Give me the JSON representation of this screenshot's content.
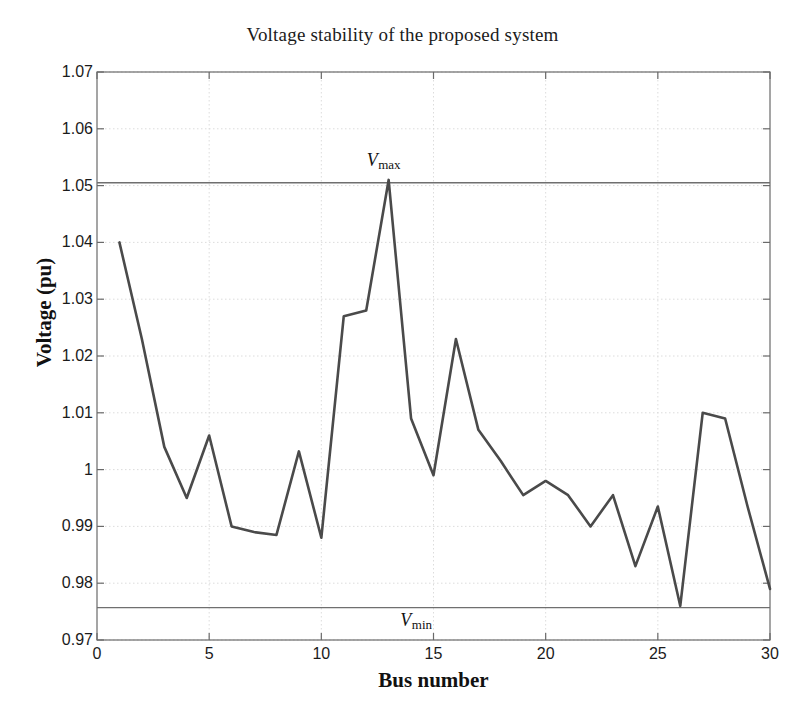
{
  "chart_data": {
    "type": "line",
    "title": "Voltage stability of the proposed system",
    "xlabel": "Bus number",
    "ylabel": "Voltage (pu)",
    "xlim": [
      0,
      30
    ],
    "ylim": [
      0.97,
      1.07
    ],
    "grid": true,
    "legend": "none",
    "xticks": [
      0,
      5,
      10,
      15,
      20,
      25,
      30
    ],
    "xtick_labels": [
      "0",
      "5",
      "10",
      "15",
      "20",
      "25",
      "30"
    ],
    "yticks": [
      0.97,
      0.98,
      0.99,
      1.0,
      1.01,
      1.02,
      1.03,
      1.04,
      1.05,
      1.06,
      1.07
    ],
    "ytick_labels": [
      "0.97",
      "0.98",
      "0.99",
      "1",
      "1.01",
      "1.02",
      "1.03",
      "1.04",
      "1.05",
      "1.06",
      "1.07"
    ],
    "x": [
      1,
      2,
      3,
      4,
      5,
      6,
      7,
      8,
      9,
      10,
      11,
      12,
      13,
      14,
      15,
      16,
      17,
      18,
      19,
      20,
      21,
      22,
      23,
      24,
      25,
      26,
      27,
      28,
      29,
      30
    ],
    "series": [
      {
        "name": "Voltage (pu)",
        "color": "#4a4a4a",
        "values": [
          1.04,
          1.023,
          1.004,
          0.995,
          1.006,
          0.99,
          0.989,
          0.9885,
          1.0032,
          0.988,
          1.027,
          1.028,
          1.051,
          1.009,
          0.999,
          1.023,
          1.007,
          1.0015,
          0.9955,
          0.998,
          0.9955,
          0.99,
          0.9955,
          0.983,
          0.9935,
          0.976,
          1.01,
          1.009,
          0.9935,
          0.979
        ]
      }
    ],
    "annotations": [
      {
        "name": "v-max-line",
        "type": "hline",
        "value": 1.0505,
        "label_main": "V",
        "label_sub": "max",
        "label_x": 13,
        "color": "#6f6f6f"
      },
      {
        "name": "v-min-line",
        "type": "hline",
        "value": 0.9757,
        "label_main": "V",
        "label_sub": "min",
        "label_x": 14.5,
        "color": "#6f6f6f"
      }
    ]
  },
  "figure": {
    "background": "#ffffff",
    "axes_color": "#6a6a6a",
    "grid_color": "#d8d8d8",
    "text_color": "#1b1b1b"
  }
}
